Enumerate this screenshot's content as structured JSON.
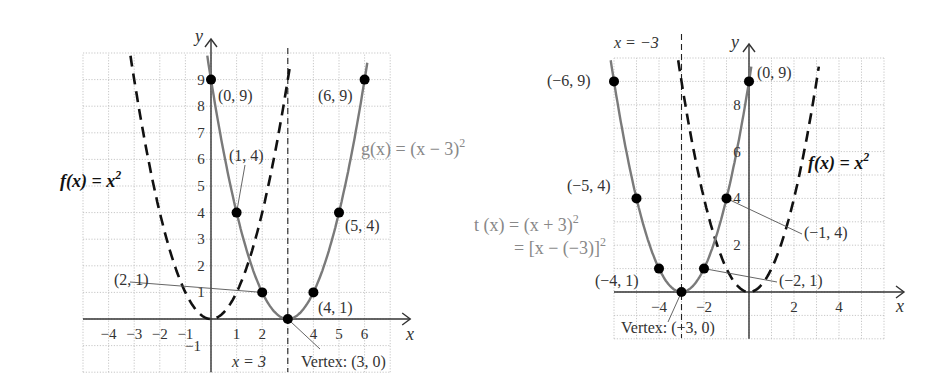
{
  "chart_data": [
    {
      "type": "line",
      "title": "Horizontal shift right: g(x) = (x − 3)^2",
      "xlabel": "x",
      "ylabel": "y",
      "xlim": [
        -5,
        7
      ],
      "ylim": [
        -2,
        10
      ],
      "grid": true,
      "x_ticks": [
        "−4",
        "−3",
        "−2",
        "−1",
        "1",
        "2",
        "4",
        "5",
        "6"
      ],
      "x_tick_values": [
        -4,
        -3,
        -2,
        -1,
        1,
        2,
        4,
        5,
        6
      ],
      "y_ticks": [
        "−1",
        "1",
        "2",
        "3",
        "4",
        "5",
        "6",
        "7",
        "8",
        "9"
      ],
      "y_tick_values": [
        -1,
        1,
        2,
        3,
        4,
        5,
        6,
        7,
        8,
        9
      ],
      "series": [
        {
          "name": "f(x) = x²",
          "style": "dashed",
          "color": "#111111",
          "h": 0
        },
        {
          "name": "g(x) = (x − 3)²",
          "style": "solid",
          "color": "#7a7a7a",
          "h": 3,
          "points": [
            [
              0,
              9
            ],
            [
              1,
              4
            ],
            [
              2,
              1
            ],
            [
              3,
              0
            ],
            [
              4,
              1
            ],
            [
              5,
              4
            ],
            [
              6,
              9
            ]
          ]
        }
      ],
      "axis_of_symmetry": {
        "x": 3,
        "label": "x = 3"
      },
      "annotations": {
        "f_label": "f(x) = x",
        "f_exp": "2",
        "g_label": "g(x) = (x − 3)",
        "g_exp": "2",
        "vertex": "Vertex: (3, 0)",
        "p0": "(0, 9)",
        "p1": "(1, 4)",
        "p2": "(2, 1)",
        "p4": "(4, 1)",
        "p5": "(5, 4)",
        "p6": "(6, 9)"
      }
    },
    {
      "type": "line",
      "title": "Horizontal shift left: t(x) = (x + 3)^2",
      "xlabel": "x",
      "ylabel": "y",
      "xlim": [
        -6,
        6
      ],
      "ylim": [
        -2,
        10
      ],
      "grid": true,
      "x_ticks": [
        "−4",
        "−2",
        "2",
        "4"
      ],
      "x_tick_values": [
        -4,
        -2,
        2,
        4
      ],
      "y_ticks": [
        "2",
        "4",
        "6",
        "8"
      ],
      "y_tick_values": [
        2,
        4,
        6,
        8
      ],
      "series": [
        {
          "name": "f(x) = x²",
          "style": "dashed",
          "color": "#111111",
          "h": 0
        },
        {
          "name": "t(x) = (x + 3)²",
          "style": "solid",
          "color": "#7a7a7a",
          "h": -3,
          "points": [
            [
              -6,
              9
            ],
            [
              -5,
              4
            ],
            [
              -4,
              1
            ],
            [
              -3,
              0
            ],
            [
              -2,
              1
            ],
            [
              -1,
              4
            ],
            [
              0,
              9
            ]
          ]
        }
      ],
      "axis_of_symmetry": {
        "x": -3,
        "label": "x = −3"
      },
      "annotations": {
        "f_label": "f(x) = x",
        "f_exp": "2",
        "t_label1": "t (x) = (x + 3)",
        "t_exp1": "2",
        "t_label2": "= [x − (−3)]",
        "t_exp2": "2",
        "vertex": "Vertex: (−3, 0)",
        "pm6": "(−6, 9)",
        "pm5": "(−5, 4)",
        "pm4": "(−4, 1)",
        "pm2": "(−2, 1)",
        "pm1": "(−1, 4)",
        "p0": "(0, 9)"
      }
    }
  ],
  "axis_labels": {
    "x": "x",
    "y": "y"
  }
}
